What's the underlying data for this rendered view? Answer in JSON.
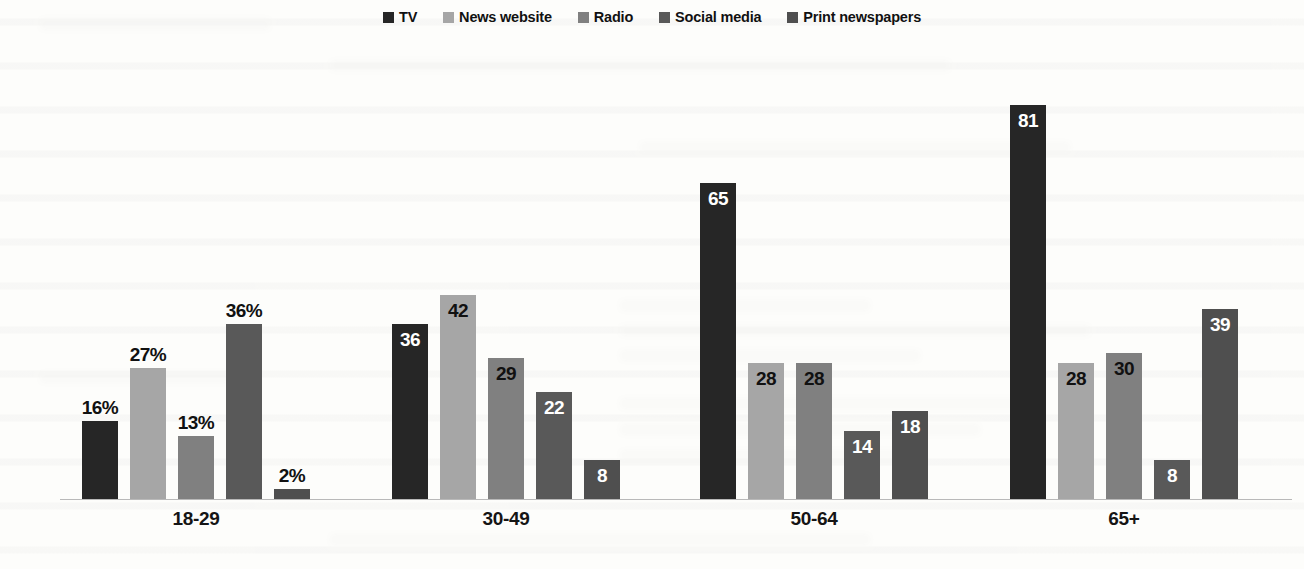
{
  "chart_data": {
    "type": "bar",
    "title": "",
    "subtitle": "",
    "xlabel": "",
    "ylabel": "",
    "ylim": [
      0,
      90
    ],
    "grid": false,
    "legend_position": "top-center",
    "orientation": "vertical",
    "grouping": "grouped",
    "categories": [
      "18-29",
      "30-49",
      "50-64",
      "65+"
    ],
    "series": [
      {
        "name": "TV",
        "color": "#262626",
        "values": [
          16,
          36,
          65,
          81
        ],
        "labels": [
          "16%",
          "36",
          "65",
          "81"
        ]
      },
      {
        "name": "News website",
        "color": "#a6a6a6",
        "values": [
          27,
          42,
          28,
          28
        ],
        "labels": [
          "27%",
          "42",
          "28",
          "28"
        ]
      },
      {
        "name": "Radio",
        "color": "#808080",
        "values": [
          13,
          29,
          28,
          30
        ],
        "labels": [
          "13%",
          "29",
          "28",
          "30"
        ]
      },
      {
        "name": "Social media",
        "color": "#595959",
        "values": [
          36,
          22,
          14,
          8
        ],
        "labels": [
          "36%",
          "22",
          "14",
          "8"
        ]
      },
      {
        "name": "Print newspapers",
        "color": "#4f4f4f",
        "values": [
          2,
          8,
          18,
          39
        ],
        "labels": [
          "2%",
          "8",
          "18",
          "39"
        ]
      }
    ],
    "label_placement": [
      [
        "outside",
        "outside",
        "outside",
        "outside",
        "outside"
      ],
      [
        "inside",
        "inside",
        "inside",
        "inside",
        "inside"
      ],
      [
        "inside",
        "inside",
        "inside",
        "inside",
        "inside"
      ],
      [
        "inside",
        "inside",
        "inside",
        "inside",
        "inside"
      ]
    ],
    "axis_color": "#b9b9b9"
  },
  "legend": {
    "items": [
      {
        "label": "TV",
        "color": "#262626",
        "swatch_name": "legend-swatch-tv"
      },
      {
        "label": "News website",
        "color": "#a6a6a6",
        "swatch_name": "legend-swatch-news-website"
      },
      {
        "label": "Radio",
        "color": "#808080",
        "swatch_name": "legend-swatch-radio"
      },
      {
        "label": "Social media",
        "color": "#595959",
        "swatch_name": "legend-swatch-social-media"
      },
      {
        "label": "Print newspapers",
        "color": "#4f4f4f",
        "swatch_name": "legend-swatch-print-newspapers"
      }
    ]
  }
}
